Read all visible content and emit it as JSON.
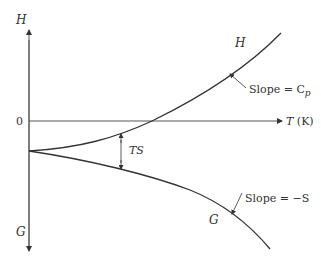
{
  "diagram": {
    "type": "thermodynamic-function-plot",
    "axes": {
      "vertical_top_label": "H",
      "vertical_bottom_label": "G",
      "horizontal_label": "T (K)",
      "zero_label": "0"
    },
    "curves": [
      {
        "name": "H",
        "label": "H",
        "annotation": "Slope = C",
        "annotation_sub": "p"
      },
      {
        "name": "G",
        "label": "G",
        "annotation": "Slope = −S"
      }
    ],
    "gap_label": "TS",
    "colors": {
      "line": "#333333",
      "axis": "#555555",
      "background": "#ffffff"
    }
  }
}
